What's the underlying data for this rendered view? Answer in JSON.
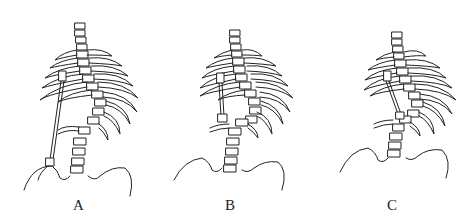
{
  "figure": {
    "panels": [
      {
        "label": "A",
        "description": "Scoliotic spine with long distraction rod from upper thoracic hook to pelvis (iliac) anchor"
      },
      {
        "label": "B",
        "description": "Scoliotic spine with short distraction rod spanning thoracic curve"
      },
      {
        "label": "C",
        "description": "Scoliotic spine with short oblique rod spanning thoracic curve"
      }
    ]
  }
}
